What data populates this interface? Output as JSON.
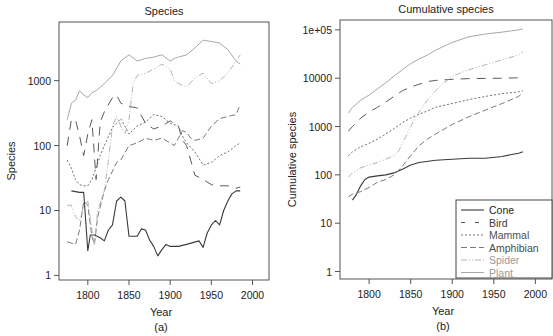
{
  "chart_data": [
    {
      "id": "a",
      "type": "line",
      "title": "Species",
      "xlabel": "Year",
      "ylabel": "Species",
      "panel_label": "(a)",
      "yscale": "log",
      "xlim": [
        1765,
        2020
      ],
      "ylim": [
        0.85,
        8000
      ],
      "xticks": [
        1800,
        1850,
        1900,
        1950,
        2000
      ],
      "yticks": [
        {
          "v": 1,
          "label": "1"
        },
        {
          "v": 10,
          "label": "10"
        },
        {
          "v": 100,
          "label": "100"
        },
        {
          "v": 1000,
          "label": "1000"
        }
      ],
      "grid": false,
      "legend": null,
      "series": [
        {
          "name": "Cone",
          "x": [
            1780,
            1790,
            1795,
            1800,
            1803,
            1808,
            1815,
            1820,
            1825,
            1830,
            1835,
            1840,
            1845,
            1850,
            1855,
            1860,
            1865,
            1870,
            1875,
            1880,
            1885,
            1890,
            1895,
            1900,
            1910,
            1920,
            1935,
            1940,
            1945,
            1950,
            1955,
            1960,
            1965,
            1970,
            1975,
            1980,
            1985
          ],
          "y": [
            20,
            19,
            19,
            2.4,
            4.2,
            4.2,
            3.8,
            3.4,
            5.0,
            6.0,
            14,
            16,
            14,
            4.0,
            4.0,
            4.0,
            5.2,
            5.0,
            3.5,
            2.8,
            2.0,
            2.5,
            3.0,
            2.8,
            2.8,
            3.0,
            3.4,
            2.7,
            4.5,
            6.0,
            7.0,
            6.0,
            10,
            14,
            18,
            20,
            20
          ]
        },
        {
          "name": "Bird",
          "x": [
            1775,
            1780,
            1785,
            1790,
            1795,
            1800,
            1805,
            1810,
            1815,
            1820,
            1830,
            1835,
            1840,
            1850,
            1860,
            1870,
            1880,
            1890,
            1900,
            1910,
            1915,
            1920,
            1930,
            1940,
            1950,
            1960,
            1970,
            1980,
            1985
          ],
          "y": [
            100,
            250,
            250,
            140,
            70,
            150,
            250,
            30,
            230,
            330,
            550,
            600,
            450,
            400,
            380,
            220,
            180,
            200,
            240,
            200,
            120,
            100,
            35,
            30,
            25,
            24,
            24,
            22,
            23
          ]
        },
        {
          "name": "Mammal",
          "x": [
            1775,
            1780,
            1785,
            1790,
            1795,
            1800,
            1805,
            1810,
            1815,
            1820,
            1830,
            1840,
            1850,
            1860,
            1870,
            1880,
            1890,
            1900,
            1910,
            1915,
            1920,
            1930,
            1940,
            1950,
            1960,
            1970,
            1980,
            1985
          ],
          "y": [
            60,
            45,
            30,
            25,
            24,
            24,
            30,
            45,
            70,
            100,
            190,
            260,
            150,
            200,
            230,
            300,
            280,
            220,
            200,
            140,
            110,
            80,
            50,
            55,
            70,
            80,
            100,
            110
          ]
        },
        {
          "name": "Amphibian",
          "x": [
            1775,
            1785,
            1790,
            1795,
            1800,
            1805,
            1808,
            1812,
            1820,
            1825,
            1835,
            1840,
            1850,
            1860,
            1870,
            1880,
            1890,
            1900,
            1905,
            1910,
            1915,
            1920,
            1925,
            1930,
            1940,
            1950,
            1960,
            1970,
            1980,
            1985
          ],
          "y": [
            3.3,
            3.0,
            5,
            14,
            12,
            4,
            3,
            8,
            20,
            30,
            55,
            60,
            100,
            110,
            130,
            120,
            130,
            110,
            100,
            130,
            170,
            160,
            130,
            120,
            130,
            200,
            260,
            280,
            300,
            430
          ]
        },
        {
          "name": "Spider",
          "x": [
            1775,
            1780,
            1785,
            1790,
            1795,
            1800,
            1805,
            1808,
            1812,
            1820,
            1825,
            1830,
            1835,
            1840,
            1845,
            1850,
            1855,
            1860,
            1870,
            1880,
            1890,
            1900,
            1905,
            1910,
            1920,
            1930,
            1940,
            1950,
            1960,
            1970,
            1980,
            1985
          ],
          "y": [
            12,
            12,
            8,
            7,
            12,
            14,
            5,
            3,
            10,
            20,
            60,
            200,
            280,
            200,
            150,
            250,
            900,
            1200,
            1300,
            1500,
            1800,
            1500,
            1000,
            900,
            800,
            1100,
            1300,
            900,
            1000,
            1300,
            2000,
            2500
          ]
        },
        {
          "name": "Plant",
          "x": [
            1775,
            1780,
            1785,
            1790,
            1795,
            1800,
            1805,
            1810,
            1820,
            1830,
            1840,
            1850,
            1860,
            1870,
            1880,
            1890,
            1900,
            1905,
            1910,
            1920,
            1930,
            1940,
            1950,
            1960,
            1970,
            1980,
            1985
          ],
          "y": [
            250,
            450,
            500,
            700,
            600,
            550,
            650,
            700,
            900,
            1200,
            2000,
            2500,
            2000,
            2200,
            2300,
            2500,
            2000,
            2200,
            2300,
            2500,
            3200,
            4200,
            4000,
            3800,
            3000,
            2000,
            1800
          ]
        }
      ]
    },
    {
      "id": "b",
      "type": "line",
      "title": "Cumulative species",
      "xlabel": "Year",
      "ylabel": "Cumulative species",
      "panel_label": "(b)",
      "yscale": "log",
      "xlim": [
        1765,
        2020
      ],
      "ylim": [
        0.7,
        160000
      ],
      "xticks": [
        1800,
        1850,
        1900,
        1950,
        2000
      ],
      "yticks": [
        {
          "v": 1,
          "label": "1"
        },
        {
          "v": 10,
          "label": "10"
        },
        {
          "v": 100,
          "label": "100"
        },
        {
          "v": 1000,
          "label": "1000"
        },
        {
          "v": 10000,
          "label": "10000"
        },
        {
          "v": 100000,
          "label": "1e+05"
        }
      ],
      "grid": false,
      "legend": {
        "position": "bottom-right",
        "entries": [
          "Cone",
          "Bird",
          "Mammal",
          "Amphibian",
          "Spider",
          "Plant"
        ]
      },
      "series": [
        {
          "name": "Cone",
          "x": [
            1780,
            1785,
            1790,
            1795,
            1800,
            1810,
            1820,
            1830,
            1840,
            1850,
            1860,
            1880,
            1900,
            1920,
            1940,
            1960,
            1970,
            1980,
            1985
          ],
          "y": [
            30,
            40,
            60,
            80,
            90,
            95,
            100,
            110,
            130,
            160,
            180,
            200,
            210,
            220,
            220,
            240,
            260,
            280,
            300
          ]
        },
        {
          "name": "Bird",
          "x": [
            1775,
            1780,
            1790,
            1800,
            1810,
            1820,
            1830,
            1840,
            1850,
            1860,
            1870,
            1880,
            1900,
            1920,
            1940,
            1960,
            1980,
            1985
          ],
          "y": [
            800,
            1000,
            1500,
            2000,
            2500,
            3200,
            4200,
            5500,
            6500,
            7500,
            8500,
            9000,
            9500,
            9800,
            9900,
            10000,
            10200,
            10300
          ]
        },
        {
          "name": "Mammal",
          "x": [
            1775,
            1780,
            1790,
            1800,
            1810,
            1820,
            1830,
            1840,
            1850,
            1860,
            1870,
            1880,
            1900,
            1920,
            1940,
            1960,
            1980,
            1985
          ],
          "y": [
            250,
            300,
            380,
            450,
            550,
            700,
            900,
            1200,
            1500,
            1800,
            2100,
            2500,
            3000,
            3600,
            4200,
            4800,
            5200,
            5500
          ]
        },
        {
          "name": "Amphibian",
          "x": [
            1775,
            1780,
            1790,
            1800,
            1810,
            1820,
            1830,
            1840,
            1850,
            1860,
            1870,
            1880,
            1900,
            1920,
            1940,
            1960,
            1980,
            1985
          ],
          "y": [
            35,
            40,
            45,
            55,
            70,
            80,
            100,
            150,
            250,
            400,
            550,
            700,
            1100,
            1600,
            2200,
            3000,
            4200,
            5000
          ]
        },
        {
          "name": "Spider",
          "x": [
            1775,
            1780,
            1790,
            1800,
            1810,
            1820,
            1830,
            1835,
            1840,
            1850,
            1860,
            1870,
            1880,
            1890,
            1900,
            1920,
            1940,
            1960,
            1980,
            1985
          ],
          "y": [
            90,
            110,
            140,
            160,
            180,
            210,
            250,
            300,
            450,
            1000,
            2000,
            3500,
            5500,
            8000,
            11000,
            15000,
            19000,
            24000,
            30000,
            35000
          ]
        },
        {
          "name": "Plant",
          "x": [
            1775,
            1780,
            1790,
            1800,
            1810,
            1820,
            1830,
            1840,
            1850,
            1860,
            1870,
            1880,
            1900,
            1920,
            1940,
            1960,
            1980,
            1985
          ],
          "y": [
            1900,
            2500,
            3500,
            4500,
            6000,
            8000,
            11000,
            15000,
            20000,
            25000,
            30000,
            38000,
            55000,
            72000,
            82000,
            90000,
            100000,
            105000
          ]
        }
      ]
    }
  ],
  "series_styles": {
    "Cone": {
      "color": "#3a3a3a",
      "dash": "",
      "width": 1.1,
      "legend_color": "#1e1e1e"
    },
    "Bird": {
      "color": "#5a5a5a",
      "dash": "9 7",
      "width": 1.0,
      "legend_color": "#3a3a3a"
    },
    "Mammal": {
      "color": "#6e6e6e",
      "dash": "2 2",
      "width": 1.0,
      "legend_color": "#505050"
    },
    "Amphibian": {
      "color": "#7a7a7a",
      "dash": "6 3",
      "width": 1.0,
      "legend_color": "#4a4a4a"
    },
    "Spider": {
      "color": "#b4b4b4",
      "dash": "6 2 1 2 1 2",
      "width": 1.0,
      "legend_color": "#9a9a9a"
    },
    "Plant": {
      "color": "#a8a8a8",
      "dash": "",
      "width": 1.0,
      "legend_color": "#999999"
    }
  },
  "layout": {
    "panels": {
      "a": {
        "left": 59,
        "right": 269,
        "top": 22,
        "bottom": 280,
        "ylabel_x": 12,
        "title_y": 15,
        "xlabel_y": 316,
        "panel_label_y": 331
      },
      "b": {
        "left": 340,
        "right": 552,
        "top": 20,
        "bottom": 279,
        "ylabel_x": 293,
        "title_y": 13,
        "xlabel_y": 315,
        "panel_label_y": 330
      }
    }
  }
}
